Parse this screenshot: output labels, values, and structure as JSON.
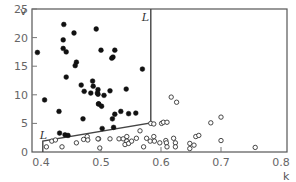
{
  "chart_data": {
    "type": "scatter",
    "title": "",
    "xlabel": "k",
    "ylabel": "v",
    "xlim": [
      0.385,
      0.81
    ],
    "ylim": [
      0,
      25
    ],
    "x_ticks": [
      0.4,
      0.5,
      0.6,
      0.7,
      0.8
    ],
    "x_tick_labels": [
      "0.4",
      "0.5",
      "0.6",
      "0.7",
      "0.8"
    ],
    "y_ticks": [
      0,
      5,
      10,
      15,
      20,
      25
    ],
    "y_tick_labels": [
      "0",
      "5",
      "10",
      "15",
      "20",
      "25"
    ],
    "grid": false,
    "legend": null,
    "annotations": [
      {
        "text": "L",
        "x": 0.568,
        "y": 23.6
      },
      {
        "text": "L",
        "x": 0.398,
        "y": 2.9
      }
    ],
    "boundary": {
      "name": "L",
      "points": [
        [
          0.403,
          0
        ],
        [
          0.403,
          1.9
        ],
        [
          0.583,
          5.1
        ],
        [
          0.583,
          25
        ]
      ]
    },
    "series": [
      {
        "name": "filled",
        "marker": "filled-circle",
        "color": "#111111",
        "points": [
          [
            0.394,
            17.4
          ],
          [
            0.437,
            19.6
          ],
          [
            0.437,
            18.1
          ],
          [
            0.442,
            17.5
          ],
          [
            0.438,
            22.3
          ],
          [
            0.455,
            20.8
          ],
          [
            0.492,
            21.5
          ],
          [
            0.459,
            15.7
          ],
          [
            0.457,
            15.1
          ],
          [
            0.5,
            17.8
          ],
          [
            0.523,
            17.8
          ],
          [
            0.52,
            16.6
          ],
          [
            0.518,
            16.4
          ],
          [
            0.569,
            14.5
          ],
          [
            0.442,
            13.1
          ],
          [
            0.467,
            11.7
          ],
          [
            0.487,
            11.5
          ],
          [
            0.486,
            12.4
          ],
          [
            0.472,
            10.6
          ],
          [
            0.483,
            10.3
          ],
          [
            0.494,
            10.3
          ],
          [
            0.495,
            10.9
          ],
          [
            0.495,
            10.1
          ],
          [
            0.496,
            8.4
          ],
          [
            0.505,
            9.9
          ],
          [
            0.515,
            10.7
          ],
          [
            0.542,
            11.0
          ],
          [
            0.496,
            8.4
          ],
          [
            0.501,
            8.0
          ],
          [
            0.406,
            9.1
          ],
          [
            0.43,
            7.1
          ],
          [
            0.47,
            5.8
          ],
          [
            0.523,
            6.6
          ],
          [
            0.533,
            7.1
          ],
          [
            0.519,
            5.8
          ],
          [
            0.546,
            6.7
          ],
          [
            0.558,
            6.8
          ],
          [
            0.431,
            3.3
          ],
          [
            0.44,
            3.0
          ],
          [
            0.445,
            2.9
          ],
          [
            0.502,
            4.1
          ],
          [
            0.521,
            4.3
          ]
        ]
      },
      {
        "name": "open",
        "marker": "open-circle",
        "color": "#333333",
        "points": [
          [
            0.409,
            0.9
          ],
          [
            0.418,
            1.9
          ],
          [
            0.424,
            2.1
          ],
          [
            0.435,
            0.9
          ],
          [
            0.459,
            1.6
          ],
          [
            0.471,
            2.2
          ],
          [
            0.477,
            2.7
          ],
          [
            0.478,
            2.1
          ],
          [
            0.496,
            2.3
          ],
          [
            0.495,
            2.3
          ],
          [
            0.515,
            2.3
          ],
          [
            0.53,
            2.3
          ],
          [
            0.537,
            2.3
          ],
          [
            0.543,
            2.7
          ],
          [
            0.543,
            1.9
          ],
          [
            0.54,
            1.3
          ],
          [
            0.546,
            1.5
          ],
          [
            0.551,
            1.9
          ],
          [
            0.559,
            2.4
          ],
          [
            0.576,
            2.4
          ],
          [
            0.582,
            1.9
          ],
          [
            0.589,
            1.9
          ],
          [
            0.571,
            0.9
          ],
          [
            0.498,
            0.7
          ],
          [
            0.565,
            3.7
          ],
          [
            0.583,
            5.0
          ],
          [
            0.588,
            4.9
          ],
          [
            0.601,
            5.0
          ],
          [
            0.604,
            5.2
          ],
          [
            0.61,
            5.2
          ],
          [
            0.588,
            2.7
          ],
          [
            0.598,
            1.6
          ],
          [
            0.608,
            2.0
          ],
          [
            0.609,
            1.6
          ],
          [
            0.61,
            0.9
          ],
          [
            0.621,
            2.4
          ],
          [
            0.624,
            1.6
          ],
          [
            0.624,
            0.9
          ],
          [
            0.648,
            1.5
          ],
          [
            0.648,
            0.6
          ],
          [
            0.655,
            1.2
          ],
          [
            0.658,
            2.7
          ],
          [
            0.663,
            2.9
          ],
          [
            0.617,
            9.6
          ],
          [
            0.626,
            8.7
          ],
          [
            0.683,
            5.1
          ],
          [
            0.7,
            6.1
          ],
          [
            0.7,
            2.0
          ],
          [
            0.757,
            0.8
          ]
        ]
      }
    ]
  },
  "axes": {
    "x_label": "k",
    "y_label": "v"
  }
}
